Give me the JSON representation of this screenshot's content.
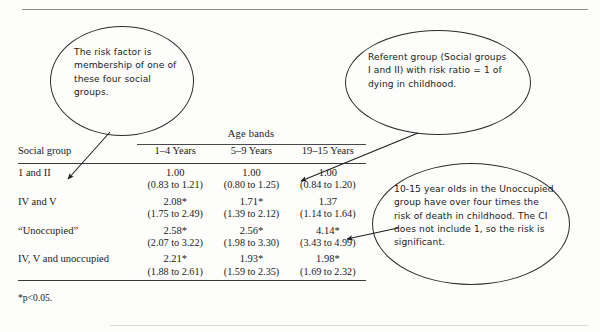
{
  "document": {
    "type": "annotated-statistics-table",
    "footnote": "*p<0.05."
  },
  "table": {
    "spanner_label": "Age bands",
    "headers": {
      "group": "Social group",
      "bands": [
        "1–4 Years",
        "5–9 Years",
        "19–15 Years"
      ]
    },
    "rows": [
      {
        "group": "1 and II",
        "values": [
          "1.00",
          "1.00",
          "1.00"
        ],
        "ci": [
          "(0.83 to 1.21)",
          "(0.80 to 1.25)",
          "(0.84 to 1.20)"
        ]
      },
      {
        "group": "IV and V",
        "values": [
          "2.08*",
          "1.71*",
          "1.37"
        ],
        "ci": [
          "(1.75 to 2.49)",
          "(1.39 to 2.12)",
          "(1.14 to 1.64)"
        ]
      },
      {
        "group": "“Unoccupied”",
        "values": [
          "2.58*",
          "2.56*",
          "4.14*"
        ],
        "ci": [
          "(2.07 to 3.22)",
          "(1.98 to 3.30)",
          "(3.43 to 4.99)"
        ]
      },
      {
        "group": "IV, V and unoccupied",
        "values": [
          "2.21*",
          "1.93*",
          "1.98*"
        ],
        "ci": [
          "(1.88 to 2.61)",
          "(1.59 to 2.35)",
          "(1.69 to 2.32)"
        ]
      }
    ]
  },
  "callouts": {
    "left": {
      "text": "The risk factor is membership of one of these four social groups."
    },
    "middle": {
      "text": "Referent group (Social groups I and II) with risk ratio = 1 of dying in childhood."
    },
    "right": {
      "text": "10-15 year olds in the Unoccupied group have over four times the risk of death in childhood. The CI does not include 1, so the risk is significant."
    }
  },
  "colors": {
    "page_background": "#fdfdfc",
    "text": "#1a1a1a",
    "rule": "#3a3a3a",
    "callout_outline": "#2b2b2b",
    "page_rule": "#8d8d8d"
  }
}
